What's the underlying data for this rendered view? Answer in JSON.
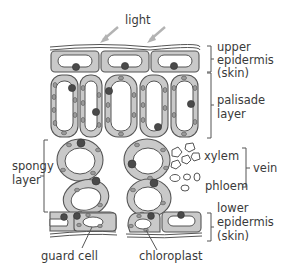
{
  "diagram": {
    "labels": {
      "light": "light",
      "upper_epidermis": [
        "upper",
        "epidermis",
        "(skin)"
      ],
      "palisade_layer": [
        "palisade",
        "layer"
      ],
      "spongy_layer": [
        "spongy",
        "layer"
      ],
      "xylem": "xylem",
      "phloem": "phloem",
      "vein": "vein",
      "lower_epidermis": [
        "lower",
        "epidermis",
        "(skin)"
      ],
      "guard_cell": "guard cell",
      "chloroplast": "chloroplast"
    },
    "colors": {
      "cell_wall_fill": "#c9c9c9",
      "outline": "#555555",
      "nucleus": "#4a4a4a",
      "light_arrow": "#b3b3b3",
      "text": "#3a3a3a"
    }
  }
}
